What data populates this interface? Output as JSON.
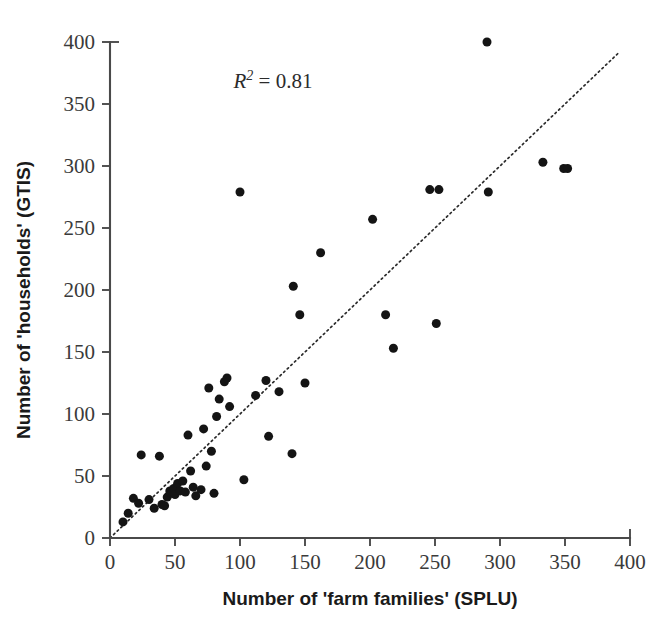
{
  "chart_data": {
    "type": "scatter",
    "title": "",
    "subtitle": "",
    "xlabel": "Number of 'farm families' (SPLU)",
    "ylabel": "Number of 'households' (GTIS)",
    "xlim": [
      0,
      400
    ],
    "ylim": [
      0,
      400
    ],
    "xticks": [
      0,
      50,
      100,
      150,
      200,
      250,
      300,
      350,
      400
    ],
    "yticks": [
      0,
      50,
      100,
      150,
      200,
      250,
      300,
      350,
      400
    ],
    "xtick_labels": [
      "0",
      "50",
      "100",
      "150",
      "200",
      "250",
      "300",
      "350",
      "400"
    ],
    "ytick_labels": [
      "0",
      "50",
      "100",
      "150",
      "200",
      "250",
      "300",
      "350",
      "400"
    ],
    "grid": false,
    "legend": null,
    "legend_position": "none",
    "annotations": [
      {
        "name": "r-squared",
        "symbol": "R",
        "superscript": "2",
        "operator": "=",
        "value": "0.81",
        "text": "R2 = 0.81",
        "x": 95,
        "y": 363
      }
    ],
    "reference_line": {
      "name": "one-to-one-line",
      "style": "dotted",
      "slope": 1,
      "intercept": 0,
      "x_from": 0,
      "x_to": 392,
      "y_from": 0,
      "y_to": 392
    },
    "series": [
      {
        "name": "villages",
        "marker": "filled-circle",
        "color": "#141414",
        "marker_size": 9,
        "points": [
          [
            10,
            13
          ],
          [
            14,
            20
          ],
          [
            18,
            32
          ],
          [
            22,
            28
          ],
          [
            24,
            67
          ],
          [
            30,
            31
          ],
          [
            34,
            24
          ],
          [
            38,
            66
          ],
          [
            40,
            27
          ],
          [
            42,
            26
          ],
          [
            44,
            33
          ],
          [
            46,
            38
          ],
          [
            47,
            36
          ],
          [
            49,
            40
          ],
          [
            50,
            35
          ],
          [
            52,
            44
          ],
          [
            54,
            38
          ],
          [
            56,
            46
          ],
          [
            58,
            37
          ],
          [
            60,
            83
          ],
          [
            62,
            54
          ],
          [
            64,
            41
          ],
          [
            66,
            34
          ],
          [
            70,
            39
          ],
          [
            72,
            88
          ],
          [
            74,
            58
          ],
          [
            76,
            121
          ],
          [
            78,
            70
          ],
          [
            80,
            36
          ],
          [
            82,
            98
          ],
          [
            84,
            112
          ],
          [
            88,
            126
          ],
          [
            90,
            129
          ],
          [
            92,
            106
          ],
          [
            100,
            279
          ],
          [
            103,
            47
          ],
          [
            112,
            115
          ],
          [
            120,
            127
          ],
          [
            122,
            82
          ],
          [
            130,
            118
          ],
          [
            140,
            68
          ],
          [
            141,
            203
          ],
          [
            146,
            180
          ],
          [
            150,
            125
          ],
          [
            162,
            230
          ],
          [
            202,
            257
          ],
          [
            212,
            180
          ],
          [
            218,
            153
          ],
          [
            246,
            281
          ],
          [
            253,
            281
          ],
          [
            251,
            173
          ],
          [
            290,
            400
          ],
          [
            291,
            279
          ],
          [
            333,
            303
          ],
          [
            349,
            298
          ],
          [
            352,
            298
          ]
        ]
      }
    ]
  },
  "axes": {
    "x_axis_name": "x-axis",
    "y_axis_name": "y-axis"
  }
}
